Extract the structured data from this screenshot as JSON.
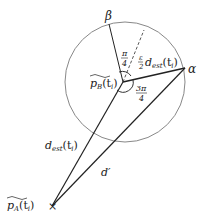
{
  "diagram": {
    "labels": {
      "beta": "β",
      "alpha": "α",
      "pb_main": "p",
      "pb_sub": "B",
      "pb_arg": "(t",
      "pb_arg_sub": "i",
      "pb_close": ")",
      "pa_main": "p",
      "pa_sub": "A",
      "pa_arg": "(t",
      "pa_arg_sub": "i",
      "pa_close": ")",
      "angle_top_num": "π",
      "angle_top_den": "4",
      "angle_bottom_num": "3π",
      "angle_bottom_den": "4",
      "frac_num": "ε",
      "frac_den": "2",
      "dest_main": "d",
      "dest_sub": "est",
      "dest_arg": "(t",
      "dest_arg_sub": "i",
      "dest_close": ")",
      "dprime": "d′",
      "x_mark": "×"
    },
    "colors": {
      "line": "#222222",
      "circle": "#888888",
      "background": "#ffffff"
    }
  }
}
